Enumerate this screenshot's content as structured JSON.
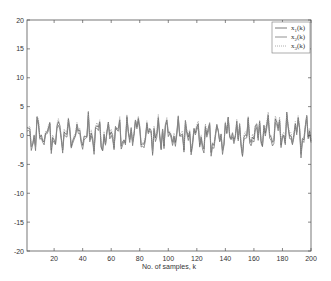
{
  "chart_data": {
    "type": "line",
    "title": "",
    "xlabel": "No. of samples, k",
    "ylabel": "",
    "xlim": [
      1,
      200
    ],
    "ylim": [
      -20,
      20
    ],
    "grid": false,
    "legend_position": "upper right",
    "x_ticks": [
      20,
      40,
      60,
      80,
      100,
      120,
      140,
      160,
      180,
      200
    ],
    "y_ticks": [
      -20,
      -15,
      -10,
      -5,
      0,
      5,
      10,
      15,
      20
    ],
    "series": [
      {
        "name": "x1(k)",
        "label_main": "x",
        "label_sub": "1",
        "label_suffix": "(k)",
        "style": "solid",
        "color": "#555555"
      },
      {
        "name": "x2(k)",
        "label_main": "x",
        "label_sub": "2",
        "label_suffix": "(k)",
        "style": "solid",
        "color": "#777777"
      },
      {
        "name": "x3(k)",
        "label_main": "x",
        "label_sub": "3",
        "label_suffix": "(k)",
        "style": "dotted",
        "color": "#999999"
      }
    ],
    "signal_description": "Three overlapping oscillating signals over 200 samples, mostly ranging between about -3.5 and 4.5, centered near 0",
    "approx_range": [
      -3.5,
      4.5
    ]
  },
  "legend": {
    "items": [
      {
        "main": "x",
        "sub": "1",
        "suffix": "(k)"
      },
      {
        "main": "x",
        "sub": "2",
        "suffix": "(k)"
      },
      {
        "main": "x",
        "sub": "3",
        "suffix": "(k)"
      }
    ]
  }
}
